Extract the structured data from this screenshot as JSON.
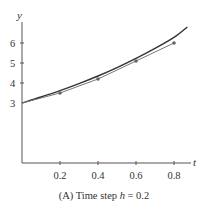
{
  "chart_data": {
    "type": "line",
    "title": "",
    "caption": {
      "prefix": "(A) Time step ",
      "var": "h",
      "suffix": " = 0.2"
    },
    "xlabel": "t",
    "ylabel": "y",
    "xlim": [
      0,
      0.88
    ],
    "ylim": [
      0,
      7
    ],
    "x_ticks": [
      0.2,
      0.4,
      0.6,
      0.8
    ],
    "x_tick_labels": [
      "0.2",
      "0.4",
      "0.6",
      "0.8"
    ],
    "y_ticks": [
      3,
      4,
      5,
      6
    ],
    "y_tick_labels": [
      "3",
      "4",
      "5",
      "6"
    ],
    "grid": false,
    "legend": "none",
    "series": [
      {
        "name": "Exact solution",
        "style": "smooth curve",
        "color": "#333333",
        "x": [
          0,
          0.1,
          0.2,
          0.3,
          0.4,
          0.5,
          0.6,
          0.7,
          0.8,
          0.87
        ],
        "values": [
          3.0,
          3.3,
          3.62,
          3.97,
          4.35,
          4.77,
          5.23,
          5.73,
          6.28,
          6.8
        ]
      },
      {
        "name": "Euler approximation",
        "style": "line with markers",
        "color": "#777777",
        "x": [
          0,
          0.2,
          0.4,
          0.6,
          0.8
        ],
        "values": [
          3.0,
          3.5,
          4.2,
          5.1,
          6.0
        ]
      }
    ]
  }
}
